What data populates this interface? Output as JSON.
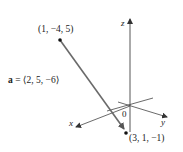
{
  "figure": {
    "vector_label": "a = ⟨2, 5, −6⟩",
    "vector_bold_part": "a",
    "vector_rest": " = ⟨2, 5, −6⟩",
    "start_point": "(1, −4, 5)",
    "end_point": "(3, 1, −1)",
    "origin_label": "0",
    "axes": {
      "x": "x",
      "y": "y",
      "z": "z"
    },
    "colors": {
      "vector": "#6a6a6a",
      "axes": "#444444",
      "text": "#222222"
    }
  }
}
